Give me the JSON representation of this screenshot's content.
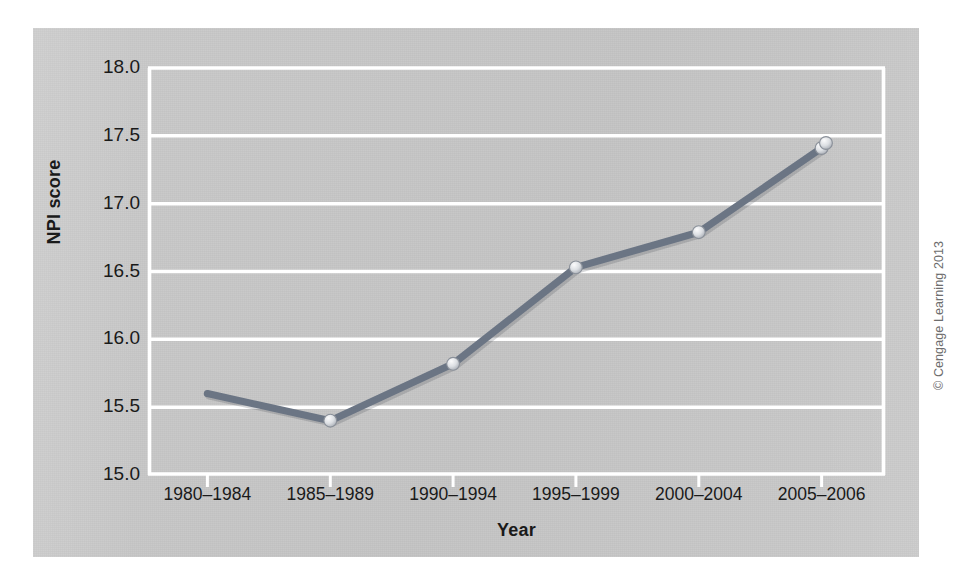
{
  "figure": {
    "panel_color": "#c9c9c9",
    "gridline_color": "#ffffff",
    "line_color": "#6b7584",
    "marker_fill": "#d9dce0",
    "text_color": "#1a1a1a",
    "copyright": "© Cengage Learning 2013"
  },
  "chart_data": {
    "type": "line",
    "title": "",
    "xlabel": "Year",
    "ylabel": "NPI score",
    "categories": [
      "1980–1984",
      "1985–1989",
      "1990–1994",
      "1995–1999",
      "2000–2004",
      "2005–2006"
    ],
    "values": [
      15.6,
      15.4,
      15.82,
      16.53,
      16.79,
      17.41
    ],
    "series": [
      {
        "name": "NPI score",
        "values": [
          15.6,
          15.4,
          15.82,
          16.53,
          16.79,
          17.41
        ]
      }
    ],
    "ylim": [
      15.0,
      18.0
    ],
    "ytick_labels": [
      "18.0",
      "17.5",
      "17.0",
      "16.5",
      "16.0",
      "15.5",
      "15.0"
    ],
    "ytick_values": [
      18.0,
      17.5,
      17.0,
      16.5,
      16.0,
      15.5,
      15.0
    ],
    "grid": "horizontal-only",
    "legend": "none",
    "markers": "circle"
  }
}
